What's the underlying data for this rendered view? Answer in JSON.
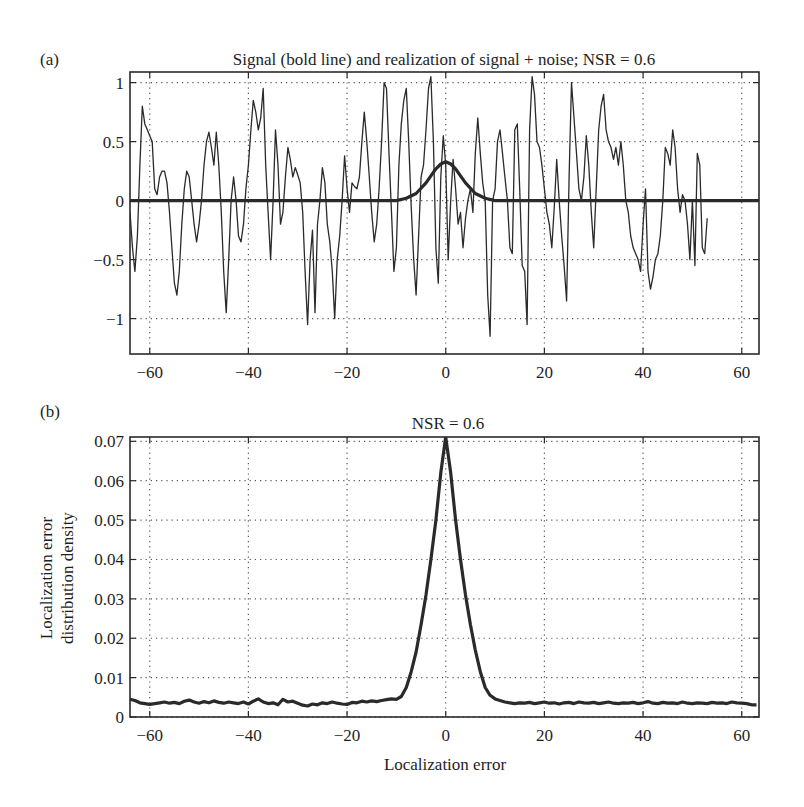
{
  "figure": {
    "panels": [
      {
        "id": "a",
        "panel_label": "(a)",
        "title": "Signal (bold line) and realization of signal + noise; NSR = 0.6",
        "xlabel": "",
        "ylabel": "",
        "xticks": [
          -60,
          -40,
          -20,
          0,
          20,
          40,
          60
        ],
        "xtick_labels": [
          "−60",
          "−40",
          "−20",
          "0",
          "20",
          "40",
          "60"
        ],
        "yticks": [
          1,
          0.5,
          0,
          -0.5,
          -1
        ],
        "ytick_labels": [
          "1",
          "0.5",
          "0",
          "−0.5",
          "−1"
        ]
      },
      {
        "id": "b",
        "panel_label": "(b)",
        "title": "NSR = 0.6",
        "xlabel": "Localization error",
        "ylabel_line1": "Localization error",
        "ylabel_line2": "distribution density",
        "xticks": [
          -60,
          -40,
          -20,
          0,
          20,
          40,
          60
        ],
        "xtick_labels": [
          "−60",
          "−40",
          "−20",
          "0",
          "20",
          "40",
          "60"
        ],
        "yticks": [
          0.07,
          0.06,
          0.05,
          0.04,
          0.03,
          0.02,
          0.01,
          0
        ],
        "ytick_labels": [
          "0.07",
          "0.06",
          "0.05",
          "0.04",
          "0.03",
          "0.02",
          "0.01",
          "0"
        ]
      }
    ]
  },
  "chart_data": [
    {
      "type": "line",
      "title": "Signal (bold line) and realization of signal + noise; NSR = 0.6",
      "panel": "(a)",
      "xlabel": "",
      "ylabel": "",
      "xlim": [
        -64,
        63.5
      ],
      "ylim": [
        -1.3,
        1.09
      ],
      "grid": true,
      "grid_style": "dotted",
      "legend": null,
      "series": [
        {
          "name": "signal + noise (thin line)",
          "style": "thin",
          "x": [
            -64,
            -63.5,
            -63,
            -62.5,
            -62,
            -61.5,
            -61,
            -60.5,
            -60,
            -59.5,
            -59,
            -58.5,
            -58,
            -57.5,
            -57,
            -56.5,
            -56,
            -55.5,
            -55,
            -54.5,
            -54,
            -53.5,
            -53,
            -52.5,
            -52,
            -51.5,
            -51,
            -50.5,
            -50,
            -49.5,
            -49,
            -48.5,
            -48,
            -47.5,
            -47,
            -46.5,
            -46,
            -45.5,
            -45,
            -44.5,
            -44,
            -43.5,
            -43,
            -42.5,
            -42,
            -41.5,
            -41,
            -40.5,
            -40,
            -39.5,
            -39,
            -38.5,
            -38,
            -37.5,
            -37,
            -36.5,
            -36,
            -35.5,
            -35,
            -34.5,
            -34,
            -33.5,
            -33,
            -32.5,
            -32,
            -31.5,
            -31,
            -30.5,
            -30,
            -29.5,
            -29,
            -28.5,
            -28,
            -27.5,
            -27,
            -26.5,
            -26,
            -25.5,
            -25,
            -24.5,
            -24,
            -23.5,
            -23,
            -22.5,
            -22,
            -21.5,
            -21,
            -20.5,
            -20,
            -19.5,
            -19,
            -18.5,
            -18,
            -17.5,
            -17,
            -16.5,
            -16,
            -15.5,
            -15,
            -14.5,
            -14,
            -13.5,
            -13,
            -12.5,
            -12,
            -11.5,
            -11,
            -10.5,
            -10,
            -9.5,
            -9,
            -8.5,
            -8,
            -7.5,
            -7,
            -6.5,
            -6,
            -5.5,
            -5,
            -4.5,
            -4,
            -3.5,
            -3,
            -2.5,
            -2,
            -1.5,
            -1,
            -0.5,
            0,
            0.5,
            1,
            1.5,
            2,
            2.5,
            3,
            3.5,
            4,
            4.5,
            5,
            5.5,
            6,
            6.5,
            7,
            7.5,
            8,
            8.5,
            9,
            9.5,
            10,
            10.5,
            11,
            11.5,
            12,
            12.5,
            13,
            13.5,
            14,
            14.5,
            15,
            15.5,
            16,
            16.5,
            17,
            17.5,
            18,
            18.5,
            19,
            19.5,
            20,
            20.5,
            21,
            21.5,
            22,
            22.5,
            23,
            23.5,
            24,
            24.5,
            25,
            25.5,
            26,
            26.5,
            27,
            27.5,
            28,
            28.5,
            29,
            29.5,
            30,
            30.5,
            31,
            31.5,
            32,
            32.5,
            33,
            33.5,
            34,
            34.5,
            35,
            35.5,
            36,
            36.5,
            37,
            37.5,
            38,
            38.5,
            39,
            39.5,
            40,
            40.5,
            41,
            41.5,
            42,
            42.5,
            43,
            43.5,
            44,
            44.5,
            45,
            45.5,
            46,
            46.5,
            47,
            47.5,
            48,
            48.5,
            49,
            49.5,
            50,
            50.5,
            51,
            51.5,
            52,
            52.5,
            53,
            53.5,
            54,
            54.5,
            55,
            55.5,
            56,
            56.5,
            57,
            57.5,
            58,
            58.5,
            59,
            59.5,
            60,
            60.5,
            61,
            61.5,
            62,
            62.5,
            63,
            63.5
          ],
          "y": [
            -0.1,
            -0.4,
            -0.6,
            -0.3,
            0.3,
            0.8,
            0.65,
            0.6,
            0.55,
            0.5,
            0.1,
            0.05,
            0.2,
            0.25,
            0.25,
            0.15,
            -0.1,
            -0.4,
            -0.7,
            -0.8,
            -0.6,
            -0.2,
            0.1,
            0.25,
            0.2,
            0.0,
            -0.2,
            -0.35,
            -0.2,
            0.0,
            0.3,
            0.5,
            0.58,
            0.45,
            0.3,
            0.58,
            0.3,
            -0.1,
            -0.6,
            -0.95,
            -0.5,
            0.0,
            0.2,
            0.0,
            -0.3,
            -0.35,
            -0.2,
            0.1,
            0.3,
            0.6,
            0.85,
            0.75,
            0.6,
            0.7,
            0.95,
            0.3,
            -0.1,
            -0.5,
            0.0,
            0.6,
            0.3,
            -0.2,
            -0.1,
            0.2,
            0.45,
            0.35,
            0.2,
            0.28,
            0.22,
            0.15,
            -0.1,
            -0.6,
            -1.05,
            -0.5,
            -0.25,
            -0.95,
            -0.2,
            0.0,
            0.28,
            0.15,
            -0.2,
            -0.35,
            -0.6,
            -1.0,
            -0.5,
            -0.3,
            0.0,
            0.38,
            0.1,
            -0.1,
            0.15,
            0.12,
            0.1,
            0.2,
            0.5,
            0.75,
            0.5,
            0.2,
            -0.1,
            -0.35,
            -0.2,
            0.1,
            0.5,
            1.0,
            0.95,
            0.4,
            -0.1,
            -0.6,
            -0.4,
            0.3,
            0.65,
            0.85,
            0.95,
            0.5,
            -0.05,
            -0.5,
            -0.8,
            -0.3,
            0.2,
            0.3,
            0.6,
            0.95,
            1.05,
            0.5,
            -0.4,
            -0.7,
            0.2,
            0.55,
            0.3,
            -0.5,
            0.0,
            0.35,
            0.1,
            -0.2,
            -0.1,
            -0.4,
            -0.15,
            0.0,
            0.1,
            -0.1,
            0.4,
            0.7,
            0.4,
            0.15,
            0.0,
            -0.8,
            -1.15,
            0.0,
            0.1,
            0.5,
            0.6,
            0.4,
            0.2,
            0.0,
            -0.4,
            -0.45,
            0.6,
            0.65,
            0.1,
            -0.55,
            -0.6,
            -1.05,
            0.6,
            1.05,
            0.9,
            0.5,
            0.45,
            0.3,
            0.1,
            -0.1,
            -0.2,
            -0.4,
            -0.05,
            0.35,
            0.0,
            -0.3,
            -0.55,
            -0.85,
            0.2,
            1.0,
            0.7,
            0.4,
            0.1,
            0.0,
            0.2,
            0.55,
            0.3,
            -0.1,
            -0.4,
            0.1,
            0.6,
            0.8,
            0.9,
            0.6,
            0.5,
            0.45,
            0.35,
            0.45,
            0.3,
            0.5,
            0.3,
            0.0,
            -0.1,
            -0.3,
            -0.4,
            -0.45,
            -0.5,
            -0.6,
            -0.2,
            0.1,
            -0.6,
            -0.75,
            -0.65,
            -0.5,
            -0.45,
            -0.3,
            0.0,
            0.45,
            0.4,
            0.3,
            0.6,
            0.45,
            0.1,
            -0.1,
            0.05,
            0.0,
            -0.2,
            -0.5,
            0.0,
            -0.55,
            0.4,
            0.3,
            -0.4,
            -0.45,
            -0.15
          ]
        },
        {
          "name": "signal (bold line)",
          "style": "bold",
          "x": [
            -64,
            -10,
            -8,
            -6,
            -4,
            -3,
            -2,
            -1,
            0,
            1,
            2,
            3,
            4,
            6,
            8,
            10,
            63.5
          ],
          "y": [
            0.0,
            0.0,
            0.02,
            0.06,
            0.15,
            0.21,
            0.27,
            0.31,
            0.33,
            0.31,
            0.27,
            0.21,
            0.15,
            0.06,
            0.02,
            0.0,
            0.0
          ]
        }
      ]
    },
    {
      "type": "line",
      "title": "NSR = 0.6",
      "panel": "(b)",
      "xlabel": "Localization error",
      "ylabel": "Localization error distribution density",
      "xlim": [
        -64,
        63.5
      ],
      "ylim": [
        0,
        0.0711
      ],
      "grid": true,
      "grid_style": "dotted",
      "legend": null,
      "series": [
        {
          "name": "localization error distribution density",
          "style": "bold",
          "x": [
            -64,
            -63,
            -62,
            -61,
            -60,
            -59,
            -58,
            -57,
            -56,
            -55,
            -54,
            -53,
            -52,
            -51,
            -50,
            -49,
            -48,
            -47,
            -46,
            -45,
            -44,
            -43,
            -42,
            -41,
            -40,
            -39,
            -38,
            -37,
            -36,
            -35,
            -34,
            -33,
            -32,
            -31,
            -30,
            -29,
            -28,
            -27,
            -26,
            -25,
            -24,
            -23,
            -22,
            -21,
            -20,
            -19,
            -18,
            -17,
            -16,
            -15,
            -14,
            -13,
            -12,
            -11,
            -10,
            -9,
            -8,
            -7,
            -6,
            -5,
            -4,
            -3,
            -2,
            -1,
            0,
            1,
            2,
            3,
            4,
            5,
            6,
            7,
            8,
            9,
            10,
            11,
            12,
            13,
            14,
            15,
            16,
            17,
            18,
            19,
            20,
            21,
            22,
            23,
            24,
            25,
            26,
            27,
            28,
            29,
            30,
            31,
            32,
            33,
            34,
            35,
            36,
            37,
            38,
            39,
            40,
            41,
            42,
            43,
            44,
            45,
            46,
            47,
            48,
            49,
            50,
            51,
            52,
            53,
            54,
            55,
            56,
            57,
            58,
            59,
            60,
            61,
            62,
            63,
            63.5
          ],
          "y": [
            0.0045,
            0.0042,
            0.0036,
            0.0034,
            0.0032,
            0.0034,
            0.0036,
            0.0038,
            0.0035,
            0.0037,
            0.0034,
            0.004,
            0.0043,
            0.0038,
            0.0035,
            0.0039,
            0.0036,
            0.0041,
            0.0037,
            0.0035,
            0.0038,
            0.0036,
            0.0034,
            0.0038,
            0.0033,
            0.004,
            0.0046,
            0.0038,
            0.0034,
            0.0036,
            0.0031,
            0.0045,
            0.0038,
            0.004,
            0.0035,
            0.003,
            0.0028,
            0.0033,
            0.0031,
            0.0036,
            0.0034,
            0.0038,
            0.0035,
            0.0033,
            0.0032,
            0.0037,
            0.0036,
            0.004,
            0.0038,
            0.0041,
            0.0039,
            0.0042,
            0.0044,
            0.0046,
            0.0045,
            0.0052,
            0.0075,
            0.0115,
            0.0165,
            0.0235,
            0.031,
            0.04,
            0.05,
            0.062,
            0.0711,
            0.062,
            0.05,
            0.04,
            0.031,
            0.0235,
            0.017,
            0.0115,
            0.0075,
            0.0055,
            0.0046,
            0.0042,
            0.0038,
            0.0036,
            0.0034,
            0.0036,
            0.0035,
            0.0037,
            0.0034,
            0.0036,
            0.0038,
            0.0035,
            0.0036,
            0.0033,
            0.0036,
            0.0037,
            0.0034,
            0.0038,
            0.0036,
            0.0035,
            0.0037,
            0.0034,
            0.0036,
            0.0038,
            0.0035,
            0.0034,
            0.0036,
            0.0035,
            0.0037,
            0.0034,
            0.0036,
            0.0039,
            0.0035,
            0.0034,
            0.0037,
            0.0035,
            0.0036,
            0.0034,
            0.0038,
            0.0035,
            0.0034,
            0.0036,
            0.0035,
            0.0034,
            0.0037,
            0.0035,
            0.0036,
            0.0034,
            0.0038,
            0.0036,
            0.0035,
            0.0034,
            0.0031,
            0.0031
          ]
        }
      ]
    }
  ],
  "layout": {
    "panels": [
      {
        "left": 130,
        "right": 759,
        "top": 72,
        "bottom": 354
      },
      {
        "left": 130,
        "right": 759,
        "top": 437,
        "bottom": 717
      }
    ],
    "colors": {
      "line": "#2a2a2a",
      "frame": "#2a2a2a",
      "grid": "#555555",
      "text": "#1e1e1e"
    }
  }
}
